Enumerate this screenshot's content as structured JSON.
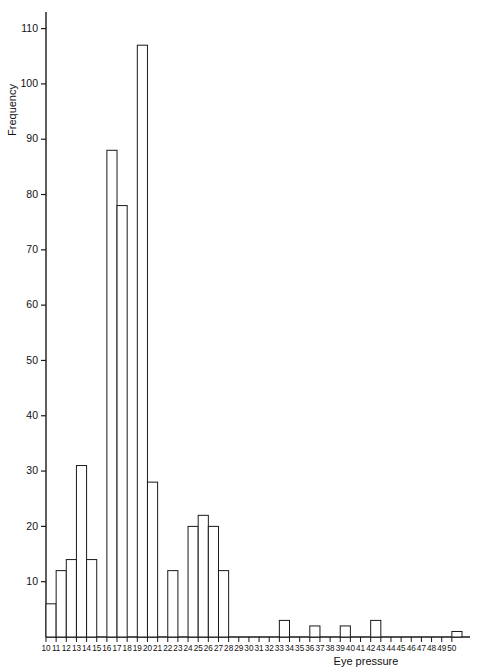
{
  "chart_data": {
    "type": "bar",
    "title": "",
    "subtitle": "",
    "xlabel": "Eye pressure",
    "ylabel": "Frequency",
    "grid": false,
    "legend": "none",
    "xlim": [
      10,
      50
    ],
    "ylim": [
      0,
      113
    ],
    "yticks": [
      10,
      20,
      30,
      40,
      50,
      60,
      70,
      80,
      90,
      100,
      110
    ],
    "ytick_labels": [
      "10",
      "20",
      "30",
      "40",
      "50",
      "60",
      "70",
      "80",
      "90",
      "100",
      "110"
    ],
    "xticks": [
      10,
      11,
      12,
      13,
      14,
      15,
      16,
      17,
      18,
      19,
      20,
      21,
      22,
      23,
      24,
      25,
      26,
      27,
      28,
      29,
      30,
      31,
      32,
      33,
      34,
      35,
      36,
      37,
      38,
      39,
      40,
      41,
      42,
      43,
      44,
      45,
      46,
      47,
      48,
      49,
      50
    ],
    "xtick_labels": [
      "10",
      "11",
      "12",
      "13",
      "14",
      "15",
      "16",
      "17",
      "18",
      "19",
      "20",
      "21",
      "22",
      "23",
      "24",
      "25",
      "26",
      "27",
      "28",
      "29",
      "30",
      "31",
      "32",
      "33",
      "34",
      "35",
      "36",
      "37",
      "38",
      "39",
      "40",
      "41",
      "42",
      "43",
      "44",
      "45",
      "46",
      "47",
      "48",
      "49",
      "50"
    ],
    "bin_width": 1,
    "categories": [
      "10",
      "11",
      "12",
      "13",
      "14",
      "15",
      "16",
      "17",
      "18",
      "19",
      "20",
      "21",
      "22",
      "23",
      "24",
      "25",
      "26",
      "27",
      "28",
      "29",
      "30",
      "31",
      "32",
      "33",
      "34",
      "35",
      "36",
      "37",
      "38",
      "39",
      "40",
      "41",
      "42",
      "43",
      "44",
      "45",
      "46",
      "47",
      "48",
      "49",
      "50"
    ],
    "values": [
      6,
      12,
      14,
      31,
      14,
      0,
      88,
      78,
      0,
      107,
      28,
      0,
      12,
      0,
      20,
      22,
      20,
      12,
      0,
      0,
      0,
      0,
      0,
      3,
      0,
      0,
      2,
      0,
      0,
      2,
      0,
      0,
      3,
      0,
      0,
      0,
      0,
      0,
      0,
      0,
      1
    ],
    "bars": [
      {
        "bin_start": 10,
        "bin_end": 11,
        "value": 6
      },
      {
        "bin_start": 11,
        "bin_end": 12,
        "value": 12
      },
      {
        "bin_start": 12,
        "bin_end": 13,
        "value": 14
      },
      {
        "bin_start": 13,
        "bin_end": 14,
        "value": 31
      },
      {
        "bin_start": 14,
        "bin_end": 15,
        "value": 14
      },
      {
        "bin_start": 16,
        "bin_end": 17,
        "value": 88
      },
      {
        "bin_start": 17,
        "bin_end": 18,
        "value": 78
      },
      {
        "bin_start": 19,
        "bin_end": 20,
        "value": 107
      },
      {
        "bin_start": 20,
        "bin_end": 21,
        "value": 28
      },
      {
        "bin_start": 22,
        "bin_end": 23,
        "value": 12
      },
      {
        "bin_start": 24,
        "bin_end": 25,
        "value": 20
      },
      {
        "bin_start": 25,
        "bin_end": 26,
        "value": 22
      },
      {
        "bin_start": 26,
        "bin_end": 27,
        "value": 20
      },
      {
        "bin_start": 27,
        "bin_end": 28,
        "value": 12
      },
      {
        "bin_start": 33,
        "bin_end": 34,
        "value": 3
      },
      {
        "bin_start": 36,
        "bin_end": 37,
        "value": 2
      },
      {
        "bin_start": 39,
        "bin_end": 40,
        "value": 2
      },
      {
        "bin_start": 42,
        "bin_end": 43,
        "value": 3
      },
      {
        "bin_start": 50,
        "bin_end": 51,
        "value": 1
      }
    ],
    "colors": {
      "bar_fill": "#ffffff",
      "bar_stroke": "#1a1a1a",
      "axis": "#1a1a1a",
      "background": "#ffffff",
      "text": "#111111"
    }
  }
}
